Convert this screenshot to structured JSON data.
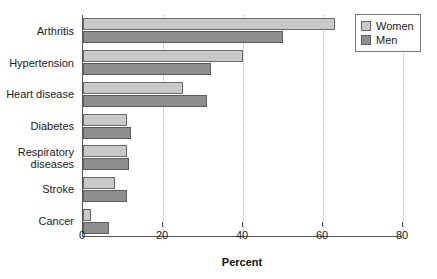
{
  "chart_data": {
    "type": "bar",
    "orientation": "horizontal",
    "title": "",
    "xlabel": "Percent",
    "ylabel": "",
    "xlim": [
      0,
      87
    ],
    "xticks": [
      0,
      20,
      40,
      60,
      80
    ],
    "xtick_labels": [
      "0",
      "20",
      "40",
      "60",
      "80"
    ],
    "grid": "vertical-dotted",
    "legend_position": "top-right",
    "categories": [
      "Arthritis",
      "Hypertension",
      "Heart disease",
      "Diabetes",
      "Respiratory\ndiseases",
      "Stroke",
      "Cancer"
    ],
    "series": [
      {
        "name": "Women",
        "color": "#c9c9c9",
        "values": [
          63,
          40,
          25,
          11,
          11,
          8,
          2
        ]
      },
      {
        "name": "Men",
        "color": "#8e8e8e",
        "values": [
          50,
          32,
          31,
          12,
          11.5,
          11,
          6.5
        ]
      }
    ]
  },
  "legend": {
    "items": [
      {
        "label": "Women"
      },
      {
        "label": "Men"
      }
    ]
  }
}
